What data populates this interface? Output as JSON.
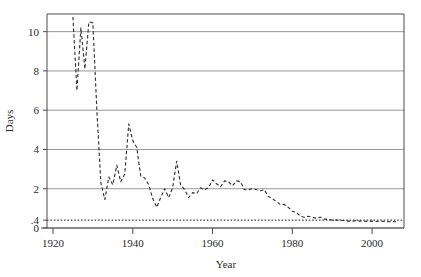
{
  "chart_data": {
    "type": "line",
    "title": "",
    "subtitle": "",
    "xlabel": "Year",
    "ylabel": "Days",
    "xlim": [
      1918.5,
      2008.0
    ],
    "ylim": [
      0,
      10.9
    ],
    "xticks": [
      1920,
      1940,
      1960,
      1980,
      2000
    ],
    "xtick_labels": [
      "1920",
      "1940",
      "1960",
      "1980",
      "2000"
    ],
    "yticks": [
      0,
      0.4,
      2,
      4,
      6,
      8,
      10
    ],
    "ytick_labels": [
      "0",
      ".4",
      "2",
      "4",
      "6",
      "8",
      "10"
    ],
    "gridlines_y": [
      0,
      2,
      4,
      6,
      8,
      10
    ],
    "grid": true,
    "legend": "none",
    "annotations": [],
    "series": [
      {
        "name": "days",
        "style": "dashed",
        "color": "#333333",
        "x": [
          1925,
          1926,
          1927,
          1928,
          1929,
          1930,
          1931,
          1932,
          1933,
          1934,
          1935,
          1936,
          1937,
          1938,
          1939,
          1940,
          1941,
          1942,
          1943,
          1944,
          1945,
          1946,
          1947,
          1948,
          1949,
          1950,
          1951,
          1952,
          1953,
          1954,
          1955,
          1956,
          1957,
          1958,
          1959,
          1960,
          1961,
          1962,
          1963,
          1964,
          1965,
          1966,
          1967,
          1968,
          1969,
          1970,
          1971,
          1972,
          1973,
          1974,
          1975,
          1976,
          1977,
          1978,
          1979,
          1980,
          1981,
          1982,
          1983,
          1984,
          1985,
          1986,
          1987,
          1988,
          1989,
          1990,
          1991,
          1992,
          1993,
          1994,
          1995,
          1996,
          1997,
          1998,
          1999,
          2000,
          2001,
          2002,
          2003,
          2004,
          2005,
          2006
        ],
        "y": [
          10.75,
          7.0,
          10.2,
          8.1,
          10.5,
          10.45,
          6.0,
          2.3,
          1.45,
          2.6,
          2.2,
          3.2,
          2.35,
          2.75,
          5.3,
          4.45,
          4.1,
          2.65,
          2.55,
          2.2,
          1.5,
          1.05,
          1.55,
          2.0,
          1.55,
          2.05,
          3.4,
          2.2,
          1.95,
          1.55,
          1.8,
          1.75,
          2.05,
          1.95,
          2.05,
          2.45,
          2.25,
          2.1,
          2.4,
          2.35,
          2.15,
          2.4,
          2.35,
          1.95,
          1.95,
          2.0,
          1.95,
          1.9,
          1.95,
          1.6,
          1.5,
          1.35,
          1.2,
          1.2,
          1.05,
          0.85,
          0.8,
          0.6,
          0.55,
          0.6,
          0.55,
          0.5,
          0.55,
          0.45,
          0.45,
          0.4,
          0.4,
          0.4,
          0.38,
          0.35,
          0.35,
          0.38,
          0.35,
          0.35,
          0.33,
          0.35,
          0.33,
          0.35,
          0.33,
          0.32,
          0.33,
          0.32
        ]
      }
    ],
    "reference_line": {
      "name": "threshold",
      "value": 0.4,
      "style": "dotted",
      "color": "#444444",
      "label": ".4"
    }
  }
}
